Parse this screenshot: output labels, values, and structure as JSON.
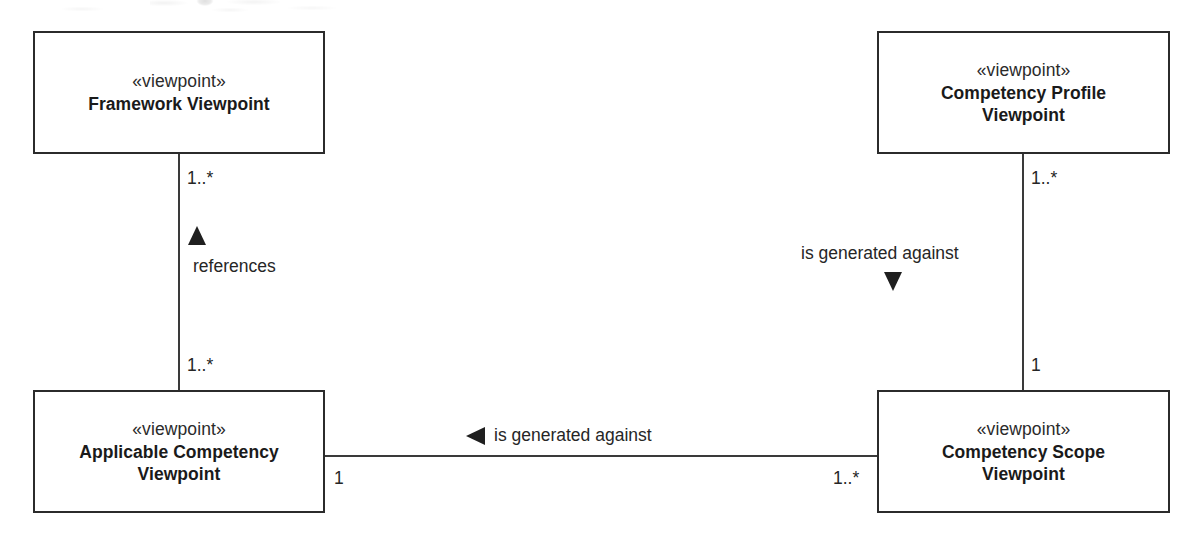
{
  "diagram": {
    "type": "uml-class-diagram",
    "stereotype_label": "«viewpoint»",
    "boxes": [
      {
        "id": "framework-viewpoint",
        "stereotype": "«viewpoint»",
        "name": "Framework Viewpoint"
      },
      {
        "id": "competency-profile-viewpoint",
        "stereotype": "«viewpoint»",
        "name": "Competency Profile\nViewpoint"
      },
      {
        "id": "applicable-competency-viewpoint",
        "stereotype": "«viewpoint»",
        "name": "Applicable Competency\nViewpoint"
      },
      {
        "id": "competency-scope-viewpoint",
        "stereotype": "«viewpoint»",
        "name": "Competency Scope\nViewpoint"
      }
    ],
    "associations": [
      {
        "id": "references",
        "label": "references",
        "direction": "up",
        "source_multiplicity": "1..*",
        "target_multiplicity": "1..*"
      },
      {
        "id": "profile-generated-against-scope",
        "label": "is generated against",
        "direction": "down",
        "source_multiplicity": "1..*",
        "target_multiplicity": "1"
      },
      {
        "id": "scope-generated-against-applicable",
        "label": "is generated against",
        "direction": "left",
        "source_multiplicity": "1",
        "target_multiplicity": "1..*"
      }
    ],
    "multiplicities": {
      "framework_lower": "1..*",
      "applicable_upper": "1..*",
      "applicable_right": "1",
      "profile_lower": "1..*",
      "scope_upper": "1",
      "scope_left": "1..*"
    },
    "colors": {
      "line": "#3a3a3a",
      "border": "#2b2b2b",
      "text": "#1a1a1a",
      "background": "#ffffff"
    }
  }
}
